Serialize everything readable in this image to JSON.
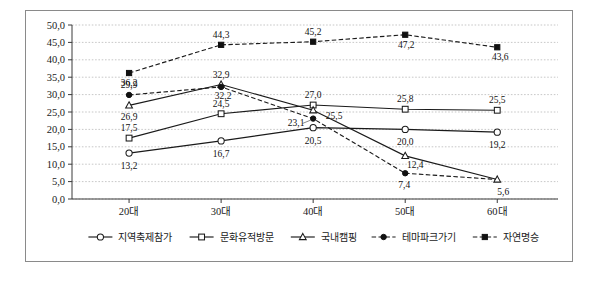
{
  "top_fragment": "· · ·  ·  · · ·  · ·· · ·· ·· ·· ·  · ·· ··· ·· ···",
  "chart_data": {
    "type": "line",
    "title": "",
    "xlabel": "",
    "ylabel": "",
    "categories": [
      "20대",
      "30대",
      "40대",
      "50대",
      "60대"
    ],
    "ylim": [
      0.0,
      50.0
    ],
    "ytick_step": 5.0,
    "ytick_labels": [
      "0,0",
      "5,0",
      "10,0",
      "15,0",
      "20,0",
      "25,0",
      "30,0",
      "35,0",
      "40,0",
      "45,0",
      "50,0"
    ],
    "grid": true,
    "decimal_separator": ",",
    "legend_position": "bottom",
    "series": [
      {
        "name": "지역축제참가",
        "marker": "circle-open",
        "line": "solid",
        "values": [
          13.2,
          16.7,
          20.5,
          20.0,
          19.2
        ],
        "labels": [
          "13,2",
          "16,7",
          "20,5",
          "20,0",
          "19,2"
        ]
      },
      {
        "name": "문화유적방문",
        "marker": "square-open",
        "line": "solid",
        "values": [
          17.5,
          24.5,
          27.0,
          25.8,
          25.5
        ],
        "labels": [
          "17,5",
          "24,5",
          "27,0",
          "25,8",
          "25,5"
        ]
      },
      {
        "name": "국내캠핑",
        "marker": "triangle-open",
        "line": "solid",
        "values": [
          26.9,
          32.9,
          25.5,
          12.4,
          5.6
        ],
        "labels": [
          "26,9",
          "32,9",
          "25,5",
          "12,4",
          "5,6"
        ]
      },
      {
        "name": "테마파크가기",
        "marker": "circle-filled",
        "line": "dashed",
        "values": [
          29.9,
          32.2,
          23.1,
          7.4,
          5.6
        ],
        "labels": [
          "29,9",
          "32,2",
          "23,1",
          "7,4",
          "5,6"
        ]
      },
      {
        "name": "자연명승",
        "marker": "square-filled",
        "line": "dashed",
        "values": [
          36.2,
          44.3,
          45.2,
          47.2,
          43.6
        ],
        "labels": [
          "36,2",
          "44,3",
          "45,2",
          "47,2",
          "43,6"
        ]
      }
    ]
  }
}
